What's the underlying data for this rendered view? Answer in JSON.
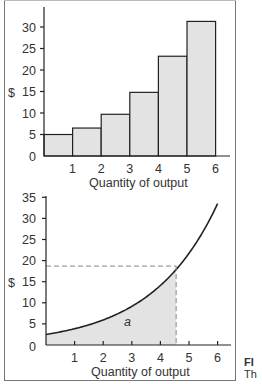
{
  "chart_data": [
    {
      "type": "bar",
      "title": "",
      "xlabel": "Quantity of output",
      "ylabel": "$",
      "categories": [
        "0-1",
        "1-2",
        "2-3",
        "3-4",
        "4-5",
        "5-6"
      ],
      "x_ticks": [
        "1",
        "2",
        "3",
        "4",
        "5",
        "6"
      ],
      "y_ticks": [
        "0",
        "5",
        "10",
        "15",
        "20",
        "25",
        "30"
      ],
      "values": [
        5,
        6.5,
        9.7,
        14.8,
        23.2,
        31.3
      ],
      "ylim": [
        0,
        33
      ],
      "xlim": [
        0,
        6.5
      ],
      "grid": false,
      "bar_fill": "#e3e3e3",
      "bar_edge": "#222222"
    },
    {
      "type": "area",
      "title": "",
      "xlabel": "Quantity of output",
      "ylabel": "$",
      "x_ticks": [
        "1",
        "2",
        "3",
        "4",
        "5",
        "6"
      ],
      "y_ticks": [
        "0",
        "5",
        "10",
        "15",
        "20",
        "25",
        "30",
        "35"
      ],
      "x": [
        0,
        0.5,
        1,
        1.5,
        2,
        2.5,
        3,
        3.5,
        4,
        4.5,
        5,
        5.5,
        6
      ],
      "values": [
        2.5,
        3.2,
        4.0,
        5.0,
        6.2,
        7.8,
        9.7,
        12.0,
        15.0,
        18.7,
        23.0,
        28.0,
        33.5
      ],
      "shaded_region": {
        "x_from": 0,
        "x_to": 4.55,
        "label": "a"
      },
      "dashed_guide": {
        "x": 4.55,
        "y": 18.7
      },
      "ylim": [
        0,
        36
      ],
      "xlim": [
        0,
        6.5
      ],
      "grid": false,
      "fill": "#e3e3e3",
      "line_color": "#222222"
    }
  ],
  "labels": {
    "top_ylabel": "$",
    "top_xlabel": "Quantity of output",
    "bottom_ylabel": "$",
    "bottom_xlabel": "Quantity of output",
    "area_label": "a",
    "caption_line1": "FI",
    "caption_line2": "Th"
  }
}
